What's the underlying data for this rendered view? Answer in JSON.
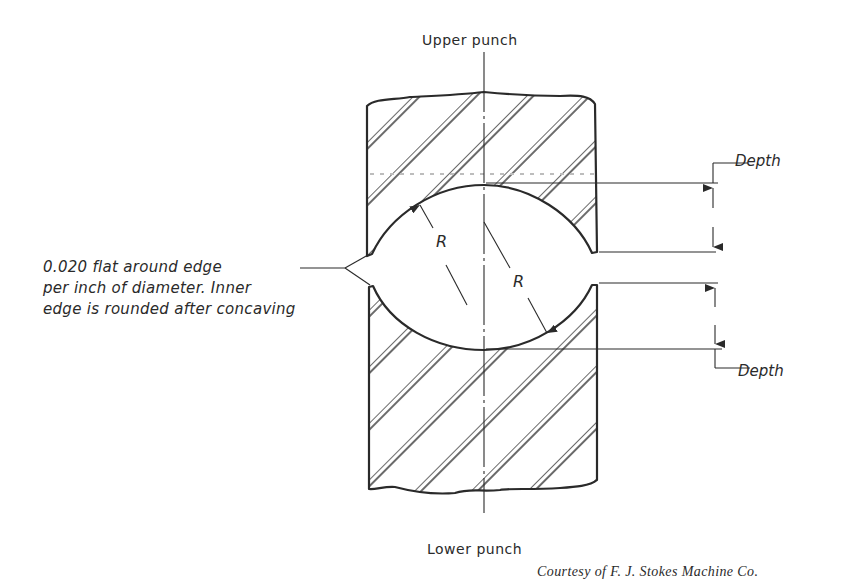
{
  "diagram": {
    "labels": {
      "upper_punch": "Upper punch",
      "lower_punch": "Lower punch",
      "depth_top": "Depth",
      "depth_bottom": "Depth",
      "radius_upper": "R",
      "radius_lower": "R",
      "note_line1": "0.020 flat around edge",
      "note_line2": "per inch of diameter. Inner",
      "note_line3": "edge is rounded after concaving",
      "credit": "Courtesy of F. J. Stokes Machine Co."
    },
    "colors": {
      "ink": "#2a2a2a",
      "background": "#ffffff"
    },
    "components": [
      {
        "name": "upper-punch",
        "fill": "diagonal hatch",
        "face": "concave"
      },
      {
        "name": "lower-punch",
        "fill": "diagonal hatch",
        "face": "concave"
      },
      {
        "name": "center-line",
        "style": "dash-dot"
      },
      {
        "name": "depth-dimension-upper",
        "arrows": 2
      },
      {
        "name": "depth-dimension-lower",
        "arrows": 2
      }
    ]
  }
}
